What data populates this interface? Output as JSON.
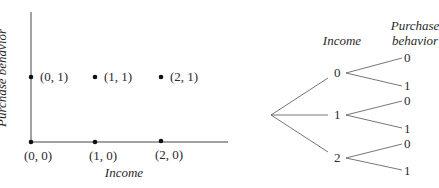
{
  "scatter": {
    "x_axis_label": "Income",
    "y_axis_label": "Purchase behavior",
    "points": [
      {
        "label": "(0, 0)",
        "x": 0,
        "y": 0
      },
      {
        "label": "(1, 0)",
        "x": 1,
        "y": 0
      },
      {
        "label": "(2, 0)",
        "x": 2,
        "y": 0
      },
      {
        "label": "(0, 1)",
        "x": 0,
        "y": 1
      },
      {
        "label": "(1, 1)",
        "x": 1,
        "y": 1
      },
      {
        "label": "(2, 1)",
        "x": 2,
        "y": 1
      }
    ]
  },
  "tree": {
    "level1_header": "Income",
    "level2_header_line1": "Purchase",
    "level2_header_line2": "behavior",
    "income_nodes": [
      "0",
      "1",
      "2"
    ],
    "purchase_leaves": [
      [
        "0",
        "1"
      ],
      [
        "0",
        "1"
      ],
      [
        "0",
        "1"
      ]
    ]
  }
}
